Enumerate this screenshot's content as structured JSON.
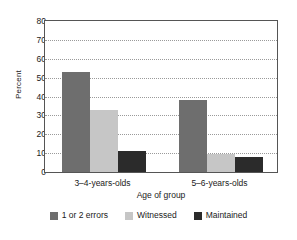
{
  "chart_data": {
    "type": "bar",
    "title": "",
    "xlabel": "Age of group",
    "ylabel": "Percent",
    "categories": [
      "3–4-years-olds",
      "5–6-years-olds"
    ],
    "series": [
      {
        "name": "1 or 2 errors",
        "values": [
          53,
          38
        ],
        "color": "#6e6e6e"
      },
      {
        "name": "Witnessed",
        "values": [
          33,
          9.5
        ],
        "color": "#c6c6c6"
      },
      {
        "name": "Maintained",
        "values": [
          11,
          8
        ],
        "color": "#2b2b2b"
      }
    ],
    "ylim": [
      0,
      80
    ],
    "yticks": [
      0,
      10,
      20,
      30,
      40,
      50,
      60,
      70,
      80
    ],
    "ytick_labels": [
      "0",
      "10",
      "20",
      "30",
      "40",
      "50",
      "60",
      "70",
      "80"
    ],
    "grid": true,
    "grid_axis": "y",
    "legend_position": "bottom",
    "frame_color": "#555555",
    "grid_color": "#9a9a9a",
    "background": "#ffffff"
  }
}
